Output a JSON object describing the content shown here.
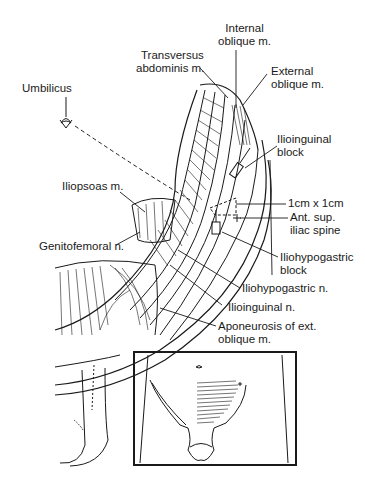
{
  "diagram": {
    "labels": {
      "internal_oblique": [
        "Internal",
        "oblique m."
      ],
      "transversus": [
        "Transversus",
        "abdominis m."
      ],
      "external_oblique": [
        "External",
        "oblique m."
      ],
      "umbilicus": [
        "Umbilicus"
      ],
      "ilioinguinal_block": [
        "Ilioinguinal",
        "block"
      ],
      "iliopsoas": [
        "Iliopsoas m."
      ],
      "one_cm": [
        "1cm x 1cm"
      ],
      "asis": [
        "Ant. sup.",
        "iliac spine"
      ],
      "genitofemoral": [
        "Genitofemoral n."
      ],
      "iliohypogastric_block": [
        "Iliohypogastric",
        "block"
      ],
      "iliohypogastric_n": [
        "Iliohypogastric n."
      ],
      "ilioinguinal_n": [
        "Ilioinguinal n."
      ],
      "aponeurosis": [
        "Aponeurosis of ext.",
        "oblique m."
      ]
    },
    "inset": {
      "description": "Frontal view of lower abdomen showing shaded block area",
      "marker": "+"
    },
    "colors": {
      "ink": "#1a1a1a",
      "background": "#ffffff"
    }
  }
}
